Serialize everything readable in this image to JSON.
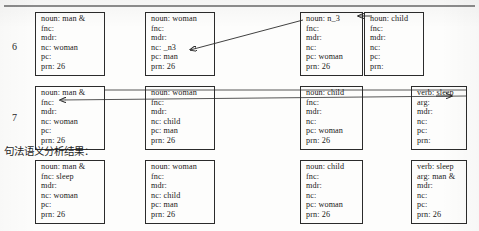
{
  "figure": {
    "caption": "句法语义分析结果：",
    "row_labels": [
      "6",
      "7"
    ],
    "attribute_names": [
      "noun",
      "verb",
      "fnc",
      "arg",
      "mdr",
      "nc",
      "pc",
      "prn"
    ]
  },
  "rows": [
    {
      "number": "6",
      "proplets": [
        {
          "lines": [
            "noun: man &",
            "fnc:",
            "mdr:",
            "nc: woman",
            "pc:",
            "prn: 26"
          ]
        },
        {
          "lines": [
            "noun: woman",
            "fnc:",
            "mdr:",
            "nc: _n3",
            "pc: man",
            "prn: 26"
          ]
        },
        {
          "lines": [
            "noun: n_3",
            "fnc:",
            "mdr:",
            "nc:",
            "pc: woman",
            "prn: 26"
          ]
        },
        {
          "lines": [
            "noun: child",
            "fnc:",
            "mdr:",
            "nc:",
            "pc:",
            "prn:"
          ]
        }
      ]
    },
    {
      "number": "7",
      "proplets": [
        {
          "lines": [
            "noun: man &",
            "fnc:",
            "mdr:",
            "nc: woman",
            "pc:",
            "prn: 26"
          ]
        },
        {
          "lines": [
            "noun: woman",
            "fnc:",
            "mdr:",
            "nc: child",
            "pc: man",
            "prn: 26"
          ]
        },
        {
          "lines": [
            "noun: child",
            "fnc:",
            "mdr:",
            "nc:",
            "pc: woman",
            "prn: 26"
          ]
        },
        {
          "lines": [
            "verb: sleep",
            "arg:",
            "mdr:",
            "nc:",
            "pc:",
            "prn:"
          ]
        }
      ]
    },
    {
      "number": "",
      "proplets": [
        {
          "lines": [
            "noun: man &",
            "fnc: sleep",
            "mdr:",
            "nc: woman",
            "pc:",
            "prn: 26"
          ]
        },
        {
          "lines": [
            "noun: woman",
            "fnc:",
            "mdr:",
            "nc: child",
            "pc: man",
            "prn: 26"
          ]
        },
        {
          "lines": [
            "noun: child",
            "fnc:",
            "mdr:",
            "nc:",
            "pc: woman",
            "prn: 26"
          ]
        },
        {
          "lines": [
            "verb: sleep",
            "arg: man &",
            "mdr:",
            "nc:",
            "pc:",
            "prn: 26"
          ]
        }
      ]
    }
  ]
}
